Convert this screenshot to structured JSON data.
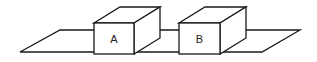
{
  "diagram": {
    "plane": {
      "points": "20,52 60,30 300,30 262,52"
    },
    "boxes": [
      {
        "label": "A"
      },
      {
        "label": "B"
      }
    ],
    "colors": {
      "stroke": "#1a1a1a",
      "fill": "#ffffff"
    }
  }
}
